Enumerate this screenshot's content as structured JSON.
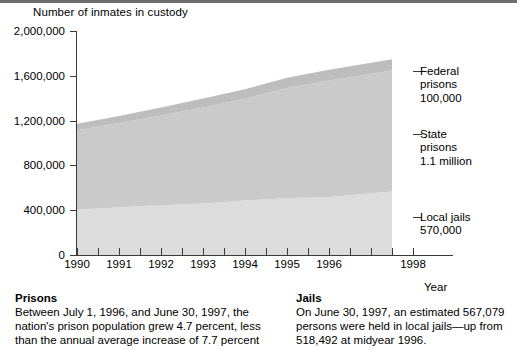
{
  "chart_data": {
    "type": "area",
    "title": "Number of inmates in custody",
    "xlabel": "Year",
    "ylabel": "",
    "stacked": true,
    "grid": false,
    "legend_position": "right",
    "xlim": [
      1990,
      1998
    ],
    "ylim": [
      0,
      2000000
    ],
    "y_ticks": [
      {
        "value": 2000000,
        "label": "2,000,000"
      },
      {
        "value": 1600000,
        "label": "1,600,000"
      },
      {
        "value": 1200000,
        "label": "1,200,000"
      },
      {
        "value": 800000,
        "label": "800,000"
      },
      {
        "value": 400000,
        "label": "400,000"
      },
      {
        "value": 0,
        "label": "0"
      }
    ],
    "x_ticks_major": [
      {
        "value": 1990,
        "label": "1990"
      },
      {
        "value": 1991,
        "label": "1991"
      },
      {
        "value": 1992,
        "label": "1992"
      },
      {
        "value": 1993,
        "label": "1993"
      },
      {
        "value": 1994,
        "label": "1994"
      },
      {
        "value": 1995,
        "label": "1995"
      },
      {
        "value": 1996,
        "label": "1996"
      },
      {
        "value": 1998,
        "label": "1998"
      }
    ],
    "x_ticks_minor": [
      1990.5,
      1991.5,
      1992.5,
      1993.5,
      1994.5,
      1995.5,
      1996.5,
      1997.0,
      1997.5
    ],
    "x": [
      1990,
      1991,
      1992,
      1993,
      1994,
      1995,
      1996,
      1997.5
    ],
    "series": [
      {
        "name": "Local jails",
        "color": "#dcdcdc",
        "values": [
          405000,
          426000,
          444000,
          459000,
          486000,
          507000,
          518000,
          567000
        ]
      },
      {
        "name": "State prisons",
        "color": "#cacaca",
        "values": [
          708000,
          753000,
          802000,
          859000,
          910000,
          985000,
          1040000,
          1080000
        ]
      },
      {
        "name": "Federal prisons",
        "color": "#bdbdbd",
        "values": [
          58000,
          63000,
          72000,
          80000,
          85000,
          90000,
          95000,
          100000
        ]
      }
    ],
    "totals": [
      1171000,
      1242000,
      1318000,
      1398000,
      1481000,
      1582000,
      1653000,
      1747000
    ],
    "annotations": [
      {
        "label": "Federal prisons",
        "value_label": "100,000"
      },
      {
        "label": "State prisons",
        "value_label": "1.1 million"
      },
      {
        "label": "Local jails",
        "value_label": "570,000"
      }
    ]
  },
  "legend": [
    {
      "line1": "Federal",
      "line2": "prisons",
      "line3": "100,000",
      "top": 65
    },
    {
      "line1": "State",
      "line2": "prisons",
      "line3": "1.1 million",
      "top": 128
    },
    {
      "line1": "Local jails",
      "line2": "570,000",
      "line3": "",
      "top": 211
    }
  ],
  "notes": {
    "left": {
      "heading": "Prisons",
      "body": "Between July 1, 1996, and June 30, 1997, the nation's prison population grew 4.7 percent, less than the annual average increase of 7.7 percent"
    },
    "right": {
      "heading": "Jails",
      "body": "On June 30, 1997, an estimated 567,079 persons were held in local jails—up from 518,492 at midyear 1996."
    }
  },
  "colors": {
    "axis": "#3a3a3a",
    "band_federal": "#bdbdbd",
    "band_state": "#cacaca",
    "band_jails": "#dcdcdc",
    "background": "#ffffff"
  }
}
